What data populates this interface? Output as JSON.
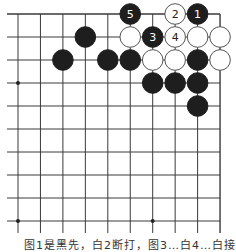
{
  "diagram": {
    "type": "go-board-fragment",
    "grid": {
      "x0": 18,
      "dx": 22.45,
      "cols": 10,
      "y0": 14,
      "dy": 23.0,
      "rows": 10,
      "extend_left": 11,
      "extend_bottom": 12,
      "right_edge": true,
      "top_edge": true,
      "line_color": "#3a3a3a"
    },
    "star_points": [
      {
        "col": 0,
        "row": 3
      },
      {
        "col": 0,
        "row": 9
      },
      {
        "col": 6,
        "row": 9
      }
    ],
    "stones": [
      {
        "col": 5,
        "row": 0,
        "color": "black",
        "label": "5"
      },
      {
        "col": 7,
        "row": 0,
        "color": "white",
        "label": "2"
      },
      {
        "col": 8,
        "row": 0,
        "color": "black",
        "label": "1"
      },
      {
        "col": 3,
        "row": 1,
        "color": "black",
        "label": ""
      },
      {
        "col": 5,
        "row": 1,
        "color": "white",
        "label": ""
      },
      {
        "col": 6,
        "row": 1,
        "color": "black",
        "label": "3"
      },
      {
        "col": 7,
        "row": 1,
        "color": "white",
        "label": "4"
      },
      {
        "col": 8,
        "row": 1,
        "color": "white",
        "label": ""
      },
      {
        "col": 9,
        "row": 1,
        "color": "white",
        "label": ""
      },
      {
        "col": 2,
        "row": 2,
        "color": "black",
        "label": ""
      },
      {
        "col": 4,
        "row": 2,
        "color": "black",
        "label": ""
      },
      {
        "col": 5,
        "row": 2,
        "color": "black",
        "label": ""
      },
      {
        "col": 6,
        "row": 2,
        "color": "white",
        "label": ""
      },
      {
        "col": 7,
        "row": 2,
        "color": "white",
        "label": ""
      },
      {
        "col": 8,
        "row": 2,
        "color": "black",
        "label": ""
      },
      {
        "col": 9,
        "row": 2,
        "color": "white",
        "label": ""
      },
      {
        "col": 6,
        "row": 3,
        "color": "black",
        "label": ""
      },
      {
        "col": 7,
        "row": 3,
        "color": "black",
        "label": ""
      },
      {
        "col": 8,
        "row": 3,
        "color": "black",
        "label": ""
      },
      {
        "col": 8,
        "row": 4,
        "color": "black",
        "label": ""
      }
    ],
    "colors": {
      "black_stone": "#1e1e1e",
      "white_stone": "#ffffff",
      "stone_outline": "#555555"
    },
    "caption": "图1是黑先，白2断打，图3…白4…白接"
  }
}
